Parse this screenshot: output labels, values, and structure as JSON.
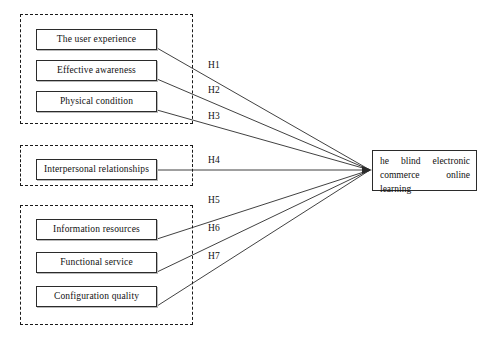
{
  "diagram": {
    "title_text": "",
    "background_color": "#ffffff",
    "line_color": "#2b2b2b",
    "dashed_color": "#1a1a1a",
    "groups": [
      {
        "name": "group-1",
        "nodes": [
          {
            "label": "The user experience"
          },
          {
            "label": "Effective awareness"
          },
          {
            "label": "Physical condition"
          }
        ]
      },
      {
        "name": "group-2",
        "nodes": [
          {
            "label": "Interpersonal relationships"
          }
        ]
      },
      {
        "name": "group-3",
        "nodes": [
          {
            "label": "Information resources"
          },
          {
            "label": "Functional service"
          },
          {
            "label": "Configuration quality"
          }
        ]
      }
    ],
    "hypotheses": [
      {
        "label": "H1"
      },
      {
        "label": "H2"
      },
      {
        "label": "H3"
      },
      {
        "label": "H4"
      },
      {
        "label": "H5"
      },
      {
        "label": "H6"
      },
      {
        "label": "H7"
      }
    ],
    "target": {
      "label": "he blind electronic commerce online learning"
    }
  }
}
